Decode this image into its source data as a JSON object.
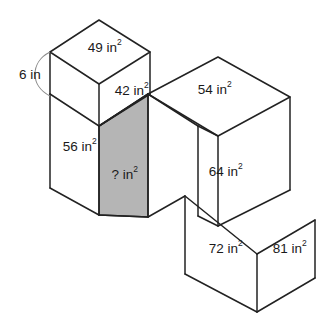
{
  "figure": {
    "background_color": "#ffffff",
    "edge_color": "#222222",
    "shaded_face_color": "#b5b5b5",
    "unknown_face_color": "#b5b5b5",
    "unit": "in",
    "dimension_callout": {
      "name": "left-edge-height",
      "label": "6 in"
    },
    "labels": [
      {
        "id": "top-face-upper-left-cube",
        "value": "49",
        "unit_text": "in",
        "exponent": "2",
        "text": "49 in²",
        "face": "top",
        "shaded": false
      },
      {
        "id": "right-face-upper-left-cube",
        "value": "42",
        "unit_text": "in",
        "exponent": "2",
        "text": "42 in²",
        "face": "right",
        "shaded": false
      },
      {
        "id": "top-face-right-cube",
        "value": "54",
        "unit_text": "in",
        "exponent": "2",
        "text": "54 in²",
        "face": "top",
        "shaded": false
      },
      {
        "id": "left-face-lower-left-cube",
        "value": "56",
        "unit_text": "in",
        "exponent": "2",
        "text": "56 in²",
        "face": "left",
        "shaded": false
      },
      {
        "id": "shaded-unknown-face",
        "value": "?",
        "unit_text": "in",
        "exponent": "2",
        "text": "? in²",
        "face": "right",
        "shaded": true
      },
      {
        "id": "left-face-middle-right-cube",
        "value": "64",
        "unit_text": "in",
        "exponent": "2",
        "text": "64 in²",
        "face": "left",
        "shaded": false
      },
      {
        "id": "left-face-bottom-right-cube",
        "value": "72",
        "unit_text": "in",
        "exponent": "2",
        "text": "72 in²",
        "face": "left",
        "shaded": false
      },
      {
        "id": "right-face-bottom-right-cube",
        "value": "81",
        "unit_text": "in",
        "exponent": "2",
        "text": "81 in²",
        "face": "right",
        "shaded": false
      }
    ]
  }
}
